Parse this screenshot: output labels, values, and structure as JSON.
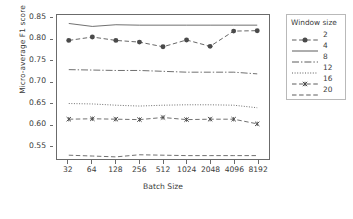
{
  "chart_data": {
    "type": "line",
    "title": "",
    "xlabel": "Batch Size",
    "ylabel": "Micro-average F1 score",
    "categories": [
      "32",
      "64",
      "128",
      "256",
      "512",
      "1024",
      "2048",
      "4096",
      "8192"
    ],
    "x_tick_labels": [
      "32",
      "64",
      "128",
      "256",
      "512",
      "1024",
      "2048",
      "4096",
      "8192"
    ],
    "y_tick_labels": [
      "0.85",
      "0.80",
      "0.75",
      "0.70",
      "0.65",
      "0.60",
      "0.55"
    ],
    "y_ticks": [
      0.85,
      0.8,
      0.75,
      0.7,
      0.65,
      0.6,
      0.55
    ],
    "ylim": [
      0.518,
      0.858
    ],
    "xlim": [
      0,
      8
    ],
    "grid": false,
    "legend_title": "Window size",
    "legend_position": "right-outside",
    "line_color": "#4a4a4a",
    "axis_color": "#6b6b6b",
    "background": "#ffffff",
    "series": [
      {
        "name": "2",
        "legend_label": "2",
        "style": "dashed-marker",
        "marker": "circle",
        "values": [
          0.798,
          0.806,
          0.798,
          0.794,
          0.783,
          0.799,
          0.784,
          0.82,
          0.821
        ]
      },
      {
        "name": "4",
        "legend_label": "4",
        "style": "solid",
        "marker": "none",
        "values": [
          0.838,
          0.831,
          0.835,
          0.834,
          0.834,
          0.834,
          0.834,
          0.834,
          0.834
        ]
      },
      {
        "name": "8",
        "legend_label": "8",
        "style": "dashdot",
        "marker": "none",
        "values": [
          0.729,
          0.728,
          0.727,
          0.727,
          0.725,
          0.723,
          0.723,
          0.723,
          0.719
        ]
      },
      {
        "name": "12",
        "legend_label": "12",
        "style": "dotted",
        "marker": "none",
        "values": [
          0.649,
          0.648,
          0.645,
          0.643,
          0.645,
          0.646,
          0.646,
          0.645,
          0.639
        ]
      },
      {
        "name": "16",
        "legend_label": "16",
        "style": "dashed-marker",
        "marker": "x",
        "values": [
          0.612,
          0.613,
          0.612,
          0.611,
          0.616,
          0.611,
          0.612,
          0.612,
          0.601
        ]
      },
      {
        "name": "20",
        "legend_label": "20",
        "style": "dashed",
        "marker": "none",
        "values": [
          0.527,
          0.525,
          0.523,
          0.528,
          0.527,
          0.526,
          0.526,
          0.526,
          0.526
        ]
      }
    ]
  }
}
